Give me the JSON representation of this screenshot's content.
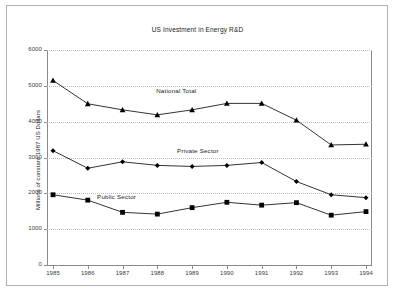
{
  "chart_data": {
    "type": "line",
    "title": "US Investment in Energy R&D",
    "xlabel": "",
    "ylabel": "Millions of constant 1987 US Dollars",
    "categories": [
      "1985",
      "1986",
      "1987",
      "1988",
      "1989",
      "1990",
      "1991",
      "1992",
      "1993",
      "1994"
    ],
    "ylim": [
      0,
      6000
    ],
    "ytick_labels": [
      "0",
      "1000",
      "2000",
      "3000",
      "4000",
      "5000",
      "6000"
    ],
    "yticks": [
      0,
      1000,
      2000,
      3000,
      4000,
      5000,
      6000
    ],
    "grid": true,
    "legend_position": "inline-annotations",
    "series": [
      {
        "name": "National Total",
        "marker": "triangle",
        "color": "#000000",
        "values": [
          5150,
          4500,
          4330,
          4190,
          4330,
          4510,
          4510,
          4040,
          3350,
          3370
        ]
      },
      {
        "name": "Private Sector",
        "marker": "diamond",
        "color": "#000000",
        "values": [
          3190,
          2700,
          2880,
          2780,
          2750,
          2780,
          2860,
          2330,
          1960,
          1880
        ]
      },
      {
        "name": "Public Sector",
        "marker": "square",
        "color": "#000000",
        "values": [
          1960,
          1810,
          1470,
          1420,
          1600,
          1750,
          1670,
          1740,
          1390,
          1490
        ]
      }
    ],
    "annotations": [
      {
        "text": "National Total",
        "x": "1988.6",
        "y": 4850
      },
      {
        "text": "Private Sector",
        "x": "1989.2",
        "y": 3180
      },
      {
        "text": "Public Sector",
        "x": "1986.9",
        "y": 1900
      }
    ]
  },
  "colors": {
    "frame": "#b0b0b0",
    "axis": "#8a8a8a",
    "grid": "#bdbdbd",
    "text": "#1a1a1a",
    "tick_text": "#3a3a3a",
    "series": "#000000",
    "background": "#ffffff"
  }
}
